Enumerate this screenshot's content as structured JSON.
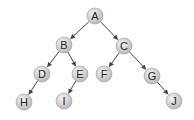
{
  "diagram": {
    "type": "binary-tree",
    "nodes": [
      {
        "id": "A",
        "label": "A",
        "x": 95,
        "y": 16
      },
      {
        "id": "B",
        "label": "B",
        "x": 64,
        "y": 45
      },
      {
        "id": "C",
        "label": "C",
        "x": 124,
        "y": 46
      },
      {
        "id": "D",
        "label": "D",
        "x": 42,
        "y": 74
      },
      {
        "id": "E",
        "label": "E",
        "x": 80,
        "y": 74
      },
      {
        "id": "F",
        "label": "F",
        "x": 104,
        "y": 74
      },
      {
        "id": "G",
        "label": "G",
        "x": 152,
        "y": 76
      },
      {
        "id": "H",
        "label": "H",
        "x": 24,
        "y": 102
      },
      {
        "id": "I",
        "label": "I",
        "x": 64,
        "y": 101
      },
      {
        "id": "J",
        "label": "J",
        "x": 174,
        "y": 101
      }
    ],
    "edges": [
      {
        "from": "A",
        "to": "B"
      },
      {
        "from": "A",
        "to": "C"
      },
      {
        "from": "B",
        "to": "D"
      },
      {
        "from": "B",
        "to": "E"
      },
      {
        "from": "C",
        "to": "F"
      },
      {
        "from": "C",
        "to": "G"
      },
      {
        "from": "D",
        "to": "H"
      },
      {
        "from": "E",
        "to": "I"
      },
      {
        "from": "G",
        "to": "J"
      }
    ],
    "colors": {
      "node_fill_light": "#f2f2f2",
      "node_fill_dark": "#b8b8b8",
      "node_stroke": "#9a9a9a",
      "edge": "#444444",
      "label": "#222222"
    }
  }
}
